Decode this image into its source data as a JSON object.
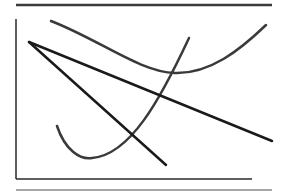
{
  "diagram": {
    "title": "",
    "colors": {
      "rule_top": "#3a3a3a",
      "rule_bottom": "#8a8a8a",
      "axes": "#2a2a2a",
      "curves": "#3a3a3a",
      "lines": "#1a1a1a"
    },
    "elements": {
      "top_rule": {
        "x1": 16,
        "y1": 5,
        "x2": 272,
        "y2": 5
      },
      "bottom_rule": {
        "x1": 16,
        "y1": 190,
        "x2": 272,
        "y2": 190
      },
      "y_axis": {
        "x1": 16,
        "y1": 19,
        "x2": 16,
        "y2": 179
      },
      "x_axis": {
        "x1": 16,
        "y1": 179,
        "x2": 252,
        "y2": 179
      },
      "line_a": {
        "x1": 29,
        "y1": 42,
        "x2": 272,
        "y2": 141
      },
      "line_b": {
        "x1": 29,
        "y1": 42,
        "x2": 166,
        "y2": 165
      },
      "curve_upper": {
        "start": [
          51,
          21
        ],
        "minimum": [
          175,
          73
        ],
        "end": [
          266,
          25
        ]
      },
      "curve_lower": {
        "start": [
          57,
          126
        ],
        "minimum": [
          90,
          158
        ],
        "end": [
          189,
          38
        ]
      }
    }
  }
}
